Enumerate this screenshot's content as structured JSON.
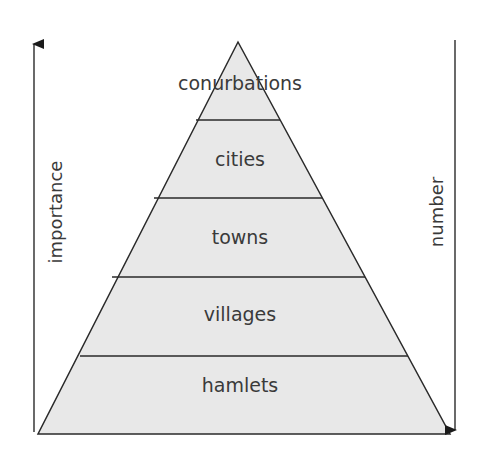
{
  "diagram": {
    "type": "settlement-hierarchy-pyramid",
    "levels": [
      {
        "label": "conurbations"
      },
      {
        "label": "cities"
      },
      {
        "label": "towns"
      },
      {
        "label": "villages"
      },
      {
        "label": "hamlets"
      }
    ],
    "left_axis": {
      "label": "importance",
      "direction": "up"
    },
    "right_axis": {
      "label": "number",
      "direction": "down"
    },
    "colors": {
      "fill": "#e8e8e8",
      "stroke": "#2a2a2a",
      "text": "#3a3a3a"
    }
  }
}
